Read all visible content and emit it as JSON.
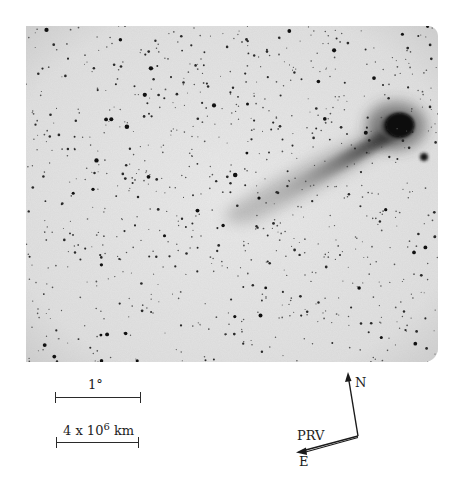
{
  "figure": {
    "photo": {
      "description": "Negative (inverted) photographic plate of a comet with a long tail against a dense star field",
      "background_color": "#e4e4e4",
      "comet": {
        "head": {
          "cx": 372,
          "cy": 100,
          "rx": 20,
          "ry": 17,
          "color": "#0c0c0c"
        },
        "tail_direction": "extends from head toward lower-left",
        "companion_star": {
          "cx": 398,
          "cy": 131,
          "r": 4
        }
      },
      "starfield": {
        "seed": 7,
        "count": 900
      }
    },
    "scale_bars": [
      {
        "id": "angular",
        "label": "1°",
        "length_px": 84
      },
      {
        "id": "linear",
        "label_prefix": "4 x 10",
        "label_exp": "6",
        "label_unit": " km",
        "length_px": 81
      }
    ],
    "compass": {
      "north_label": "N",
      "east_label": "E",
      "prv_label": "PRV"
    }
  }
}
